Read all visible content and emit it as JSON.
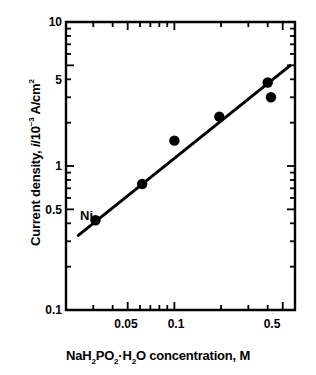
{
  "chart_data": {
    "type": "scatter",
    "title": "",
    "xlabel": "NaH2PO2·H2O concentration, M",
    "ylabel": "Current density, i/10-3 A/cm2",
    "xscale": "log",
    "yscale": "log",
    "xlim": [
      0.02,
      0.6
    ],
    "ylim": [
      0.1,
      10
    ],
    "grid": false,
    "legend": "none",
    "xticks": [
      0.05,
      0.1,
      0.5
    ],
    "xtick_labels": [
      "0.05",
      "0.1",
      "0.5"
    ],
    "yticks": [
      0.1,
      0.5,
      1,
      5,
      10
    ],
    "ytick_labels": [
      "0.1",
      "0.5",
      "1",
      "5",
      "10"
    ],
    "x_minor_ticks": [
      0.03,
      0.04,
      0.06,
      0.07,
      0.08,
      0.09,
      0.2,
      0.3,
      0.4,
      0.6
    ],
    "y_minor_ticks": [
      0.2,
      0.3,
      0.4,
      0.6,
      0.7,
      0.8,
      0.9,
      2,
      3,
      4,
      6,
      7,
      8,
      9
    ],
    "series": [
      {
        "name": "Ni",
        "marker": "filled-circle",
        "color": "#000000",
        "x": [
          0.031,
          0.062,
          0.1,
          0.195,
          0.4,
          0.42
        ],
        "y": [
          0.42,
          0.75,
          1.5,
          2.2,
          3.8,
          3.0
        ]
      }
    ],
    "fit_line": {
      "name": "linear-fit",
      "color": "#000000",
      "x": [
        0.024,
        0.56
      ],
      "y": [
        0.33,
        5.0
      ]
    },
    "annotations": [
      {
        "text": "Ni",
        "x": 0.028,
        "y": 0.58
      }
    ]
  },
  "axis": {
    "y_tick_labels": [
      "10",
      "5",
      "1",
      "0.5",
      "0.1"
    ],
    "x_tick_labels": [
      "0.05",
      "0.1",
      "0.5"
    ]
  },
  "labels": {
    "y_axis_title_parts": {
      "lead": "Current density, ",
      "symbol": "i",
      "slash": "/10",
      "exponent": "−3",
      "units": " A/cm",
      "unit_exponent": "2"
    },
    "x_axis_title_parts": {
      "p1": "NaH",
      "s1": "2",
      "p2": "PO",
      "s2": "2",
      "dot": "·H",
      "s3": "2",
      "p3": "O concentration, M"
    },
    "series_annotation": "Ni"
  },
  "colors": {
    "foreground": "#000000",
    "background": "#ffffff"
  }
}
